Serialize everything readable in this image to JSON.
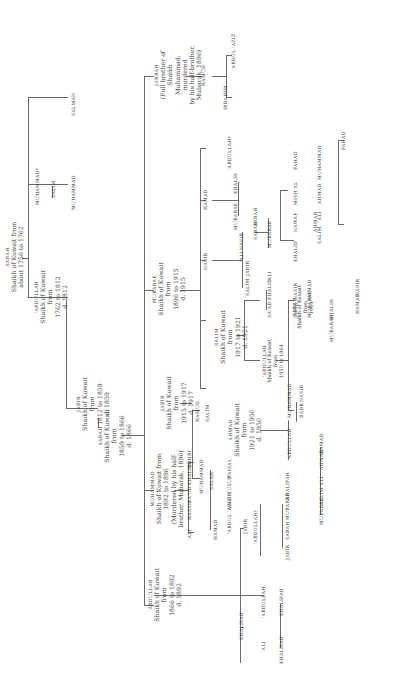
{
  "diagram": {
    "type": "family-tree",
    "orientation": "rotated-90-ccw",
    "line_color": "#6a6a6a",
    "text_color": "#3a3a3a",
    "root": {
      "name": "SABAH",
      "note": "Shaikh of Kuwait from about 1756 to 1762",
      "children": [
        "'ABDULLAH",
        "MUHAMMAD*",
        "SALMAN"
      ]
    },
    "nodes": {
      "sabah1": {
        "name": "SABAH",
        "l1": "Shaikh of Kuwait from",
        "l2": "about 1756 to 1762"
      },
      "abdullah1": {
        "name": "'ABDULLAH",
        "l1": "Shaikh of Kuwait from",
        "l2": "1762 to 1812",
        "l3": "d. 1812"
      },
      "muhammad_star": {
        "name": "MUHAMMAD*"
      },
      "salim_a": {
        "name": "SALIM"
      },
      "muhammad_a": {
        "name": "MUHAMMAD"
      },
      "salman": {
        "name": "SALMAN"
      },
      "jabir1": {
        "name": "JABIR",
        "l1": "Shaikh of Kuwait from",
        "l2": "1812 to 1859",
        "l3": "d. 1859"
      },
      "sabah2": {
        "name": "SABAH",
        "l1": "Shaikh of Kuwait from",
        "l2": "1859 to 1866",
        "l3": "d. 1866"
      },
      "abdullah2": {
        "name": "'ABDULLAH",
        "l1": "Shaikh of Kuwait from",
        "l2": "1866 to 1892",
        "l3": "d. 1892"
      },
      "muhammad2": {
        "name": "MUHAMMAD",
        "l1": "Shaikh of Kuwait from",
        "l2": "1892 to 1896",
        "l3": "(Murdered by his half-",
        "l4": "brother, Mubarak, 1896)"
      },
      "mubarak1": {
        "name": "MUBARAK",
        "l1": "Shaikh of Kuwait from",
        "l2": "1896 to 1915",
        "l3": "d. 1915"
      },
      "jarrah": {
        "name": "JARRAH",
        "l1": "(Full brother of Shaikh",
        "l2": "Muhammad; murdered",
        "l3": "by his half-brother,",
        "l4": "Mubarak, 1896)"
      },
      "hamud_j": {
        "name": "HAMUD"
      },
      "ibrahim": {
        "name": "IBRAHIM"
      },
      "abdul_aziz_j": {
        "name": "'ABDUL 'AZIZ"
      },
      "jabir2": {
        "name": "JABIR",
        "l1": "Shaikh of Kuwait from",
        "l2": "1915 to 1917",
        "l3": "d. 1917"
      },
      "salim2": {
        "name": "SALIM",
        "l1": "Shaikh of Kuwait from",
        "l2": "1917 to 1921",
        "l3": "d. 1921"
      },
      "nasir_m": {
        "name": "NASIR"
      },
      "hamad_m": {
        "name": "HAMAD"
      },
      "abdullah_dag": {
        "name": "'ABDULLAH†"
      },
      "mubarak_h": {
        "name": "MUBARAK"
      },
      "khalid_h": {
        "name": "KHALID"
      },
      "ahmad2": {
        "name": "AHMAD",
        "l1": "Shaikh of Kuwait from",
        "l2": "1921 to 1950",
        "l3": "d. 1950"
      },
      "hamud_j2": {
        "name": "HAMUD"
      },
      "salim_j2": {
        "name": "SALIM"
      },
      "abdullah3": {
        "name": "'ABDULLAH",
        "l1": "Shaikh of Kuwait from",
        "l2": "1950 to 1964"
      },
      "sabah3": {
        "name": "SABAH",
        "l1": "Shaikh of Kuwait from",
        "l2": "1964-"
      }
    },
    "leaf_labels": [
      "'ALI",
      "HASAN",
      "SA'UD",
      "KHALID",
      "ADHBI",
      "HAMAD",
      "MUHAMMAD",
      "SALAH",
      "'ABDUL 'AZIZ",
      "NASIR",
      "YUSUF",
      "FAISAL",
      "JABIR",
      "'ABDULLAH†",
      "JABIR",
      "SABAH",
      "MUBARAK",
      "KHALIFAH",
      "KHALIFAH",
      "'ALI",
      "'ABDULLAH",
      "KHALIFAH",
      "KHALIFAH",
      "'ABDULLAH",
      "MUHAMMAD",
      "BADR",
      "NASIR",
      "MUBARAK",
      "SALIM",
      "'ALI",
      "AHMAD",
      "HAMAD",
      "SA'AD",
      "KHALID",
      "'ALI",
      "JABIR",
      "NASIR",
      "MUBARAK",
      "HAMAD",
      "SALIM",
      "'ALI",
      "JABIR",
      "KHALID",
      "NAWAF",
      "AHMAD",
      "MISH'AL",
      "FAHAD",
      "SABAH",
      "NASIR",
      "MUBARAK",
      "SALIM",
      "'ALI",
      "AHMAD",
      "MUHAMMAD",
      "FAHAD",
      "SABAH",
      "HAMAD",
      "NASIR",
      "MUBARAK",
      "KHALID"
    ]
  }
}
